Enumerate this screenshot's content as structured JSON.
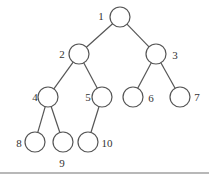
{
  "diagram": {
    "type": "binary-tree",
    "colors": {
      "stroke": "#555555",
      "label": "#333333",
      "rule": "#b8b8b8"
    },
    "node_radius": 10,
    "nodes": [
      {
        "id": "1",
        "label": "1",
        "cx": 120,
        "cy": 17,
        "lx": 101,
        "ly": 16,
        "anchor": "middle"
      },
      {
        "id": "2",
        "label": "2",
        "cx": 79,
        "cy": 54,
        "lx": 62,
        "ly": 54,
        "anchor": "middle"
      },
      {
        "id": "3",
        "label": "3",
        "cx": 156,
        "cy": 54,
        "lx": 175,
        "ly": 55,
        "anchor": "middle"
      },
      {
        "id": "4",
        "label": "4",
        "cx": 48,
        "cy": 97,
        "lx": 35,
        "ly": 97,
        "anchor": "middle"
      },
      {
        "id": "5",
        "label": "5",
        "cx": 102,
        "cy": 97,
        "lx": 88,
        "ly": 97,
        "anchor": "middle"
      },
      {
        "id": "6",
        "label": "6",
        "cx": 133,
        "cy": 97,
        "lx": 151,
        "ly": 98,
        "anchor": "middle"
      },
      {
        "id": "7",
        "label": "7",
        "cx": 180,
        "cy": 97,
        "lx": 197,
        "ly": 97,
        "anchor": "middle"
      },
      {
        "id": "8",
        "label": "8",
        "cx": 35,
        "cy": 142,
        "lx": 19,
        "ly": 143,
        "anchor": "middle"
      },
      {
        "id": "9",
        "label": "9",
        "cx": 63,
        "cy": 142,
        "lx": 62,
        "ly": 163,
        "anchor": "middle"
      },
      {
        "id": "10",
        "label": "10",
        "cx": 88,
        "cy": 142,
        "lx": 107,
        "ly": 143,
        "anchor": "middle"
      }
    ],
    "edges": [
      {
        "from": "1",
        "to": "2"
      },
      {
        "from": "1",
        "to": "3"
      },
      {
        "from": "2",
        "to": "4"
      },
      {
        "from": "2",
        "to": "5"
      },
      {
        "from": "3",
        "to": "6"
      },
      {
        "from": "3",
        "to": "7"
      },
      {
        "from": "4",
        "to": "8"
      },
      {
        "from": "4",
        "to": "9"
      },
      {
        "from": "5",
        "to": "10"
      }
    ]
  }
}
